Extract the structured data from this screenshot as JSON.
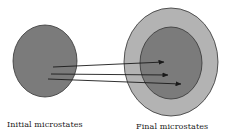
{
  "diagram": {
    "title": "",
    "colors": {
      "background": "#ffffff",
      "initial_fill": "#7b7b7b",
      "final_outer_fill": "#b3b3b3",
      "final_inner_fill": "#7b7b7b",
      "outline": "#333333",
      "arrow": "#1a1a1a"
    },
    "nodes": [
      {
        "id": "initial",
        "shape": "ellipse",
        "cx": 45,
        "cy": 61,
        "rx": 32,
        "ry": 36,
        "label": "Initial microstates"
      },
      {
        "id": "final-outer",
        "shape": "ellipse",
        "cx": 171,
        "cy": 62,
        "rx": 47,
        "ry": 54,
        "label": "Final microstates"
      },
      {
        "id": "final-inner",
        "shape": "ellipse",
        "cx": 171,
        "cy": 63,
        "rx": 31,
        "ry": 36,
        "label": ""
      }
    ],
    "arrows": [
      {
        "from": "initial",
        "to": "final-inner",
        "x1": 53,
        "y1": 67,
        "x2": 164,
        "y2": 62
      },
      {
        "from": "initial",
        "to": "final-inner",
        "x1": 51,
        "y1": 74,
        "x2": 168,
        "y2": 75
      },
      {
        "from": "initial",
        "to": "final-inner",
        "x1": 48,
        "y1": 79,
        "x2": 181,
        "y2": 84
      }
    ]
  },
  "labels": {
    "initial": "Initial microstates",
    "final": "Final microstates"
  }
}
